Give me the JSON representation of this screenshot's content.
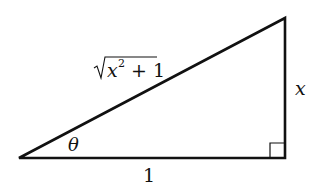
{
  "diagram": {
    "type": "right-triangle",
    "vertices": {
      "angle_vertex": [
        19,
        158
      ],
      "top_vertex": [
        285,
        18
      ],
      "right_angle_vertex": [
        285,
        158
      ]
    },
    "labels": {
      "hypotenuse": {
        "radical_body": "x",
        "exponent": "2",
        "tail": " + 1"
      },
      "angle": "θ",
      "opposite": "x",
      "adjacent": "1"
    },
    "right_angle_marker": true,
    "stroke_color": "#111111"
  }
}
